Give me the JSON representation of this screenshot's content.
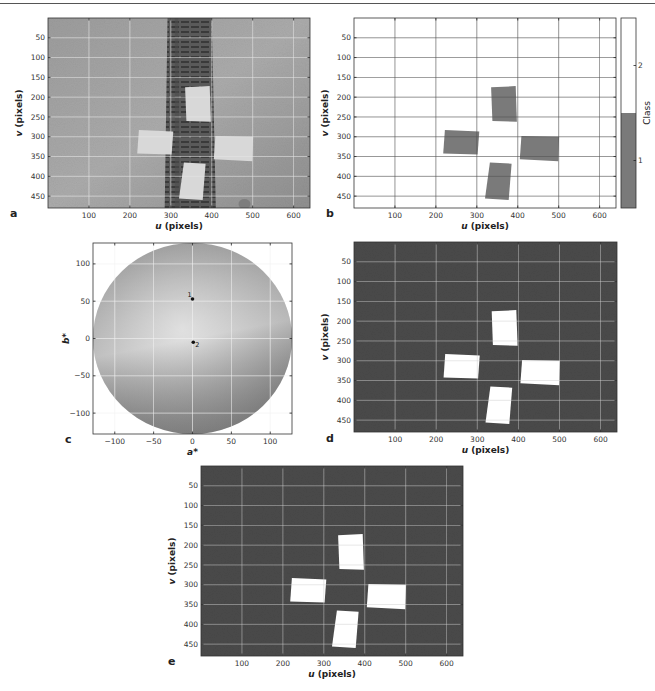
{
  "figure": {
    "panels": [
      {
        "id": "a",
        "letter": "a",
        "kind": "image",
        "description": "Original grayscale image of a tape/rail strip with four light rectangular patches",
        "frame": {
          "x": 48,
          "y": 18,
          "w": 262,
          "h": 190
        },
        "xlabel_italic": "u",
        "xlabel_rest": " (pixels)",
        "ylabel_italic": "v",
        "ylabel_rest": " (pixels)",
        "xlim": [
          0,
          640
        ],
        "ylim": [
          0,
          480
        ],
        "xticks": [
          100,
          200,
          300,
          400,
          500,
          600
        ],
        "yticks": [
          50,
          100,
          150,
          200,
          250,
          300,
          350,
          400,
          450
        ],
        "letter_pos": {
          "x": 10,
          "y": 210
        }
      },
      {
        "id": "b",
        "letter": "b",
        "kind": "classmap",
        "description": "Two-class segmentation map; class 1 (gray) for the four patches, class 2 (white) background",
        "frame": {
          "x": 354,
          "y": 18,
          "w": 262,
          "h": 190
        },
        "xlabel_italic": "u",
        "xlabel_rest": " (pixels)",
        "ylabel_italic": "v",
        "ylabel_rest": " (pixels)",
        "xlim": [
          0,
          640
        ],
        "ylim": [
          0,
          480
        ],
        "xticks": [
          100,
          200,
          300,
          400,
          500,
          600
        ],
        "yticks": [
          50,
          100,
          150,
          200,
          250,
          300,
          350,
          400,
          450
        ],
        "letter_pos": {
          "x": 326,
          "y": 210
        },
        "colorbar": {
          "frame": {
            "x": 621,
            "y": 18,
            "w": 15,
            "h": 190
          },
          "label": "Class",
          "ticks": [
            {
              "label": "2",
              "frac": 0.25
            },
            {
              "label": "1",
              "frac": 0.75
            }
          ],
          "split_frac": 0.5,
          "colors": {
            "class1": "#7a7a7a",
            "class2": "#ffffff"
          }
        }
      },
      {
        "id": "c",
        "letter": "c",
        "kind": "chromaticity",
        "description": "a*b* chromaticity disc with two cluster centers",
        "frame": {
          "x": 93,
          "y": 243,
          "w": 199,
          "h": 191
        },
        "xlabel_italic": "a*",
        "xlabel_rest": "",
        "ylabel_italic": "b*",
        "ylabel_rest": "",
        "xlim": [
          -128,
          128
        ],
        "ylim": [
          -128,
          128
        ],
        "xticks": [
          -100,
          -50,
          0,
          50,
          100
        ],
        "yticks": [
          100,
          50,
          0,
          -50,
          -100
        ],
        "letter_pos": {
          "x": 65,
          "y": 436
        }
      },
      {
        "id": "d",
        "letter": "d",
        "kind": "binary",
        "description": "Binary mask of detected patches (white) on dark noisy background",
        "frame": {
          "x": 354,
          "y": 242,
          "w": 263,
          "h": 190
        },
        "xlabel_italic": "u",
        "xlabel_rest": " (pixels)",
        "ylabel_italic": "v",
        "ylabel_rest": " (pixels)",
        "xlim": [
          0,
          640
        ],
        "ylim": [
          0,
          480
        ],
        "xticks": [
          100,
          200,
          300,
          400,
          500,
          600
        ],
        "yticks": [
          50,
          100,
          150,
          200,
          250,
          300,
          350,
          400,
          450
        ],
        "letter_pos": {
          "x": 326,
          "y": 435
        }
      },
      {
        "id": "e",
        "letter": "e",
        "kind": "binary",
        "description": "Cleaned binary mask of patches (white) on dark background",
        "frame": {
          "x": 201,
          "y": 466,
          "w": 262,
          "h": 190
        },
        "xlabel_italic": "u",
        "xlabel_rest": " (pixels)",
        "ylabel_italic": "v",
        "ylabel_rest": " (pixels)",
        "xlim": [
          0,
          640
        ],
        "ylim": [
          0,
          480
        ],
        "xticks": [
          100,
          200,
          300,
          400,
          500,
          600
        ],
        "yticks": [
          50,
          100,
          150,
          200,
          250,
          300,
          350,
          400,
          450
        ],
        "letter_pos": {
          "x": 168,
          "y": 658
        }
      }
    ],
    "patches": [
      {
        "name": "top",
        "corners": [
          [
            335,
            175
          ],
          [
            395,
            172
          ],
          [
            398,
            262
          ],
          [
            338,
            260
          ]
        ]
      },
      {
        "name": "left",
        "corners": [
          [
            222,
            283
          ],
          [
            306,
            287
          ],
          [
            302,
            345
          ],
          [
            218,
            342
          ]
        ]
      },
      {
        "name": "right",
        "corners": [
          [
            409,
            298
          ],
          [
            501,
            300
          ],
          [
            499,
            362
          ],
          [
            405,
            357
          ]
        ]
      },
      {
        "name": "bottom",
        "corners": [
          [
            332,
            365
          ],
          [
            385,
            368
          ],
          [
            378,
            460
          ],
          [
            320,
            456
          ]
        ]
      }
    ],
    "cluster_points": [
      {
        "label": "1",
        "a": 0,
        "b": 53
      },
      {
        "label": "2",
        "a": 1,
        "b": -5
      }
    ],
    "colors": {
      "photo_bg": "#a3a3a3",
      "strip": "#555555",
      "patch_light": "#d8d8d8",
      "class1": "#7a7a7a",
      "binary_bg": "#4a4a4a",
      "binary_fg": "#ffffff",
      "grid_on_dark": "#d0d0d0",
      "grid_on_light": "#555555"
    }
  },
  "chart_data": [
    {
      "type": "heatmap",
      "panel": "a",
      "title": "",
      "xlabel": "u (pixels)",
      "ylabel": "v (pixels)",
      "xlim": [
        0,
        640
      ],
      "ylim": [
        480,
        0
      ],
      "grid": true,
      "xticks": [
        100,
        200,
        300,
        400,
        500,
        600
      ],
      "yticks": [
        50,
        100,
        150,
        200,
        250,
        300,
        350,
        400,
        450
      ],
      "content": "grayscale photo: vertical dark strip u≈290-400, four light patches near (365,215), (262,313), (453,330), (353,412)"
    },
    {
      "type": "heatmap",
      "panel": "b",
      "xlabel": "u (pixels)",
      "ylabel": "v (pixels)",
      "xlim": [
        0,
        640
      ],
      "ylim": [
        480,
        0
      ],
      "grid": true,
      "colorbar": {
        "label": "Class",
        "ticks": [
          1,
          2
        ]
      },
      "classes": {
        "1": "four patches",
        "2": "background"
      }
    },
    {
      "type": "scatter",
      "panel": "c",
      "xlabel": "a*",
      "ylabel": "b*",
      "xlim": [
        -128,
        128
      ],
      "ylim": [
        -128,
        128
      ],
      "xticks": [
        -100,
        -50,
        0,
        50,
        100
      ],
      "yticks": [
        -100,
        -50,
        0,
        50,
        100
      ],
      "grid": true,
      "series": [
        {
          "name": "cluster centers",
          "points": [
            {
              "label": "1",
              "x": 0,
              "y": 53
            },
            {
              "label": "2",
              "x": 1,
              "y": -5
            }
          ]
        }
      ],
      "background": "a*b* chromaticity disc, radius 128"
    },
    {
      "type": "heatmap",
      "panel": "d",
      "xlabel": "u (pixels)",
      "ylabel": "v (pixels)",
      "xlim": [
        0,
        640
      ],
      "ylim": [
        480,
        0
      ],
      "grid": true,
      "content": "binary mask: four white patches on dark background"
    },
    {
      "type": "heatmap",
      "panel": "e",
      "xlabel": "u (pixels)",
      "ylabel": "v (pixels)",
      "xlim": [
        0,
        640
      ],
      "ylim": [
        480,
        0
      ],
      "grid": true,
      "content": "cleaned binary mask: four white patches on dark background"
    }
  ]
}
